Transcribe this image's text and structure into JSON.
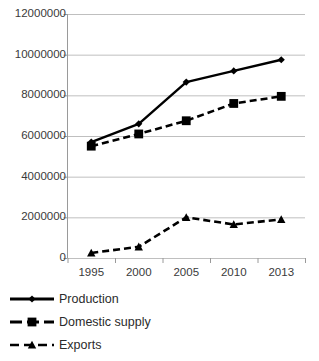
{
  "chart_data": {
    "type": "line",
    "title": "",
    "xlabel": "",
    "ylabel": "",
    "categories": [
      "1995",
      "2000",
      "2005",
      "2010",
      "2013"
    ],
    "x": [
      1995,
      2000,
      2005,
      2010,
      2013
    ],
    "ylim": [
      0,
      12000000
    ],
    "ytick_labels": [
      "12000000",
      "10000000",
      "8000000",
      "6000000",
      "4000000",
      "2000000",
      "0"
    ],
    "yticks": [
      12000000,
      10000000,
      8000000,
      6000000,
      4000000,
      2000000,
      0
    ],
    "grid": true,
    "legend_position": "below",
    "series": [
      {
        "name": "Production",
        "marker": "diamond",
        "line_style": "solid",
        "color": "#000000",
        "values": [
          5700000,
          6600000,
          8650000,
          9200000,
          9750000
        ]
      },
      {
        "name": "Domestic supply",
        "marker": "square",
        "line_style": "dashed",
        "color": "#000000",
        "values": [
          5500000,
          6100000,
          6750000,
          7600000,
          7950000
        ]
      },
      {
        "name": "Exports",
        "marker": "triangle",
        "line_style": "dashed",
        "color": "#000000",
        "values": [
          250000,
          550000,
          2000000,
          1650000,
          1900000
        ]
      }
    ]
  },
  "axis": {
    "y_labels": [
      {
        "text": "12000000",
        "value": 12000000
      },
      {
        "text": "10000000",
        "value": 10000000
      },
      {
        "text": "8000000",
        "value": 8000000
      },
      {
        "text": "6000000",
        "value": 6000000
      },
      {
        "text": "4000000",
        "value": 4000000
      },
      {
        "text": "2000000",
        "value": 2000000
      },
      {
        "text": "0",
        "value": 0
      }
    ],
    "x_labels": [
      "1995",
      "2000",
      "2005",
      "2010",
      "2013"
    ]
  },
  "legend": {
    "items": [
      {
        "label": "Production",
        "marker": "diamond",
        "line_style": "solid"
      },
      {
        "label": "Domestic supply",
        "marker": "square",
        "line_style": "dashed"
      },
      {
        "label": "Exports",
        "marker": "triangle",
        "line_style": "dashed"
      }
    ]
  },
  "colors": {
    "series": "#000000",
    "grid": "#bfbfbf",
    "axis": "#9a9a9a",
    "tick_text": "#3a3a3a",
    "legend_text": "#2b2b2b",
    "background": "#ffffff"
  }
}
